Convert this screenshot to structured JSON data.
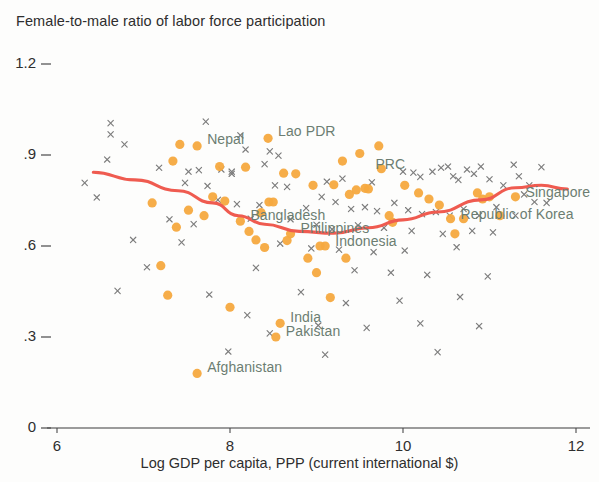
{
  "chart_data": {
    "type": "scatter",
    "title": "Female-to-male ratio of labor force participation",
    "xlabel": "Log GDP per capita, PPP (current international $)",
    "ylabel": "",
    "xlim": [
      5.6,
      12.3
    ],
    "ylim": [
      0,
      1.26
    ],
    "xticks": [
      "6",
      "8",
      "10",
      "12"
    ],
    "xtick_values": [
      6,
      8,
      10,
      12
    ],
    "yticks": [
      "1.2",
      ".9",
      ".6",
      ".3",
      "0"
    ],
    "ytick_values": [
      1.2,
      0.9,
      0.6,
      0.3,
      0
    ],
    "grid": false,
    "legend": "none",
    "colors": {
      "highlight_marker": "#F5A93F",
      "other_marker": "#7c7c7c",
      "trend_line": "#EF5B50",
      "label_text": "#6c7d72",
      "axis_text": "#2e2e2e",
      "background": "#fdfdfc"
    },
    "series": [
      {
        "name": "Asia and Pacific economies",
        "marker": "circle",
        "color": "#F5A93F",
        "labeled_points": [
          {
            "label": "Nepal",
            "x": 7.62,
            "y": 0.93,
            "label_dx": 10,
            "label_dy": -6
          },
          {
            "label": "Lao PDR",
            "x": 8.44,
            "y": 0.955,
            "label_dx": 10,
            "label_dy": -6
          },
          {
            "label": "PRC",
            "x": 9.75,
            "y": 0.855,
            "label_dx": -6,
            "label_dy": -4
          },
          {
            "label": "Bangladesh",
            "x": 8.12,
            "y": 0.682,
            "label_dx": 10,
            "label_dy": -5
          },
          {
            "label": "Philippines",
            "x": 8.7,
            "y": 0.64,
            "label_dx": 10,
            "label_dy": -5
          },
          {
            "label": "Indonesia",
            "x": 9.1,
            "y": 0.6,
            "label_dx": 10,
            "label_dy": -4
          },
          {
            "label": "Singapore",
            "x": 11.3,
            "y": 0.762,
            "label_dx": 10,
            "label_dy": -4
          },
          {
            "label": "Republic of Korea",
            "x": 10.55,
            "y": 0.69,
            "label_dx": 10,
            "label_dy": -4
          },
          {
            "label": "India",
            "x": 8.58,
            "y": 0.345,
            "label_dx": 10,
            "label_dy": -5
          },
          {
            "label": "Pakistan",
            "x": 8.53,
            "y": 0.3,
            "label_dx": 10,
            "label_dy": -5
          },
          {
            "label": "Afghanistan",
            "x": 7.62,
            "y": 0.18,
            "label_dx": 10,
            "label_dy": -5
          }
        ],
        "points": [
          {
            "x": 7.62,
            "y": 0.93
          },
          {
            "x": 8.44,
            "y": 0.955
          },
          {
            "x": 9.75,
            "y": 0.855
          },
          {
            "x": 8.12,
            "y": 0.682
          },
          {
            "x": 8.7,
            "y": 0.64
          },
          {
            "x": 9.1,
            "y": 0.6
          },
          {
            "x": 11.3,
            "y": 0.762
          },
          {
            "x": 10.55,
            "y": 0.69
          },
          {
            "x": 8.58,
            "y": 0.345
          },
          {
            "x": 8.53,
            "y": 0.3
          },
          {
            "x": 7.62,
            "y": 0.18
          },
          {
            "x": 7.42,
            "y": 0.935
          },
          {
            "x": 7.34,
            "y": 0.88
          },
          {
            "x": 7.88,
            "y": 0.862
          },
          {
            "x": 7.8,
            "y": 0.762
          },
          {
            "x": 7.94,
            "y": 0.748
          },
          {
            "x": 7.52,
            "y": 0.718
          },
          {
            "x": 7.7,
            "y": 0.7
          },
          {
            "x": 7.38,
            "y": 0.662
          },
          {
            "x": 7.2,
            "y": 0.535
          },
          {
            "x": 7.28,
            "y": 0.438
          },
          {
            "x": 8.0,
            "y": 0.398
          },
          {
            "x": 8.22,
            "y": 0.648
          },
          {
            "x": 8.3,
            "y": 0.62
          },
          {
            "x": 8.36,
            "y": 0.71
          },
          {
            "x": 8.45,
            "y": 0.745
          },
          {
            "x": 8.5,
            "y": 0.745
          },
          {
            "x": 8.62,
            "y": 0.84
          },
          {
            "x": 8.66,
            "y": 0.618
          },
          {
            "x": 8.4,
            "y": 0.595
          },
          {
            "x": 8.9,
            "y": 0.56
          },
          {
            "x": 9.0,
            "y": 0.512
          },
          {
            "x": 9.16,
            "y": 0.43
          },
          {
            "x": 8.96,
            "y": 0.8
          },
          {
            "x": 9.2,
            "y": 0.802
          },
          {
            "x": 9.38,
            "y": 0.77
          },
          {
            "x": 9.46,
            "y": 0.785
          },
          {
            "x": 9.56,
            "y": 0.79
          },
          {
            "x": 9.6,
            "y": 0.788
          },
          {
            "x": 9.3,
            "y": 0.88
          },
          {
            "x": 9.5,
            "y": 0.905
          },
          {
            "x": 9.72,
            "y": 0.93
          },
          {
            "x": 9.84,
            "y": 0.7
          },
          {
            "x": 9.88,
            "y": 0.678
          },
          {
            "x": 10.02,
            "y": 0.8
          },
          {
            "x": 10.18,
            "y": 0.775
          },
          {
            "x": 10.3,
            "y": 0.755
          },
          {
            "x": 10.42,
            "y": 0.735
          },
          {
            "x": 10.7,
            "y": 0.69
          },
          {
            "x": 10.86,
            "y": 0.775
          },
          {
            "x": 10.92,
            "y": 0.755
          },
          {
            "x": 11.0,
            "y": 0.762
          },
          {
            "x": 11.12,
            "y": 0.7
          },
          {
            "x": 8.18,
            "y": 0.86
          },
          {
            "x": 8.76,
            "y": 0.838
          },
          {
            "x": 9.04,
            "y": 0.6
          },
          {
            "x": 9.34,
            "y": 0.56
          },
          {
            "x": 10.6,
            "y": 0.64
          },
          {
            "x": 7.1,
            "y": 0.742
          }
        ]
      },
      {
        "name": "Other economies",
        "marker": "x",
        "color": "#7c7c7c",
        "points": [
          {
            "x": 6.62,
            "y": 1.005
          },
          {
            "x": 6.62,
            "y": 0.968
          },
          {
            "x": 7.72,
            "y": 1.01
          },
          {
            "x": 6.78,
            "y": 0.935
          },
          {
            "x": 8.12,
            "y": 0.965
          },
          {
            "x": 8.18,
            "y": 0.918
          },
          {
            "x": 8.46,
            "y": 0.912
          },
          {
            "x": 8.56,
            "y": 0.898
          },
          {
            "x": 8.4,
            "y": 0.87
          },
          {
            "x": 6.58,
            "y": 0.885
          },
          {
            "x": 7.18,
            "y": 0.858
          },
          {
            "x": 7.9,
            "y": 0.852
          },
          {
            "x": 7.52,
            "y": 0.845
          },
          {
            "x": 7.64,
            "y": 0.85
          },
          {
            "x": 8.02,
            "y": 0.838
          },
          {
            "x": 8.02,
            "y": 0.845
          },
          {
            "x": 6.32,
            "y": 0.808
          },
          {
            "x": 7.48,
            "y": 0.808
          },
          {
            "x": 7.74,
            "y": 0.798
          },
          {
            "x": 8.52,
            "y": 0.8
          },
          {
            "x": 8.66,
            "y": 0.795
          },
          {
            "x": 9.3,
            "y": 0.822
          },
          {
            "x": 9.12,
            "y": 0.812
          },
          {
            "x": 9.64,
            "y": 0.81
          },
          {
            "x": 10.0,
            "y": 0.845
          },
          {
            "x": 10.12,
            "y": 0.842
          },
          {
            "x": 10.2,
            "y": 0.828
          },
          {
            "x": 10.34,
            "y": 0.845
          },
          {
            "x": 10.44,
            "y": 0.858
          },
          {
            "x": 10.52,
            "y": 0.862
          },
          {
            "x": 10.58,
            "y": 0.83
          },
          {
            "x": 10.64,
            "y": 0.818
          },
          {
            "x": 10.74,
            "y": 0.852
          },
          {
            "x": 10.82,
            "y": 0.838
          },
          {
            "x": 10.9,
            "y": 0.862
          },
          {
            "x": 11.0,
            "y": 0.82
          },
          {
            "x": 11.16,
            "y": 0.8
          },
          {
            "x": 11.28,
            "y": 0.868
          },
          {
            "x": 11.6,
            "y": 0.86
          },
          {
            "x": 11.46,
            "y": 0.8
          },
          {
            "x": 7.86,
            "y": 0.752
          },
          {
            "x": 8.08,
            "y": 0.738
          },
          {
            "x": 8.34,
            "y": 0.735
          },
          {
            "x": 8.88,
            "y": 0.725
          },
          {
            "x": 9.06,
            "y": 0.762
          },
          {
            "x": 9.22,
            "y": 0.745
          },
          {
            "x": 9.4,
            "y": 0.722
          },
          {
            "x": 9.56,
            "y": 0.728
          },
          {
            "x": 9.7,
            "y": 0.715
          },
          {
            "x": 9.9,
            "y": 0.742
          },
          {
            "x": 10.06,
            "y": 0.718
          },
          {
            "x": 10.22,
            "y": 0.705
          },
          {
            "x": 10.38,
            "y": 0.712
          },
          {
            "x": 10.54,
            "y": 0.7
          },
          {
            "x": 10.7,
            "y": 0.722
          },
          {
            "x": 10.88,
            "y": 0.7
          },
          {
            "x": 11.08,
            "y": 0.728
          },
          {
            "x": 11.3,
            "y": 0.7
          },
          {
            "x": 7.3,
            "y": 0.688
          },
          {
            "x": 7.58,
            "y": 0.672
          },
          {
            "x": 8.24,
            "y": 0.69
          },
          {
            "x": 8.7,
            "y": 0.688
          },
          {
            "x": 9.0,
            "y": 0.67
          },
          {
            "x": 9.18,
            "y": 0.655
          },
          {
            "x": 9.48,
            "y": 0.668
          },
          {
            "x": 9.78,
            "y": 0.66
          },
          {
            "x": 10.1,
            "y": 0.65
          },
          {
            "x": 10.46,
            "y": 0.64
          },
          {
            "x": 10.8,
            "y": 0.65
          },
          {
            "x": 11.04,
            "y": 0.645
          },
          {
            "x": 6.88,
            "y": 0.62
          },
          {
            "x": 7.44,
            "y": 0.612
          },
          {
            "x": 8.58,
            "y": 0.608
          },
          {
            "x": 8.94,
            "y": 0.592
          },
          {
            "x": 9.26,
            "y": 0.588
          },
          {
            "x": 9.66,
            "y": 0.58
          },
          {
            "x": 10.02,
            "y": 0.585
          },
          {
            "x": 10.62,
            "y": 0.596
          },
          {
            "x": 7.04,
            "y": 0.53
          },
          {
            "x": 8.3,
            "y": 0.528
          },
          {
            "x": 9.44,
            "y": 0.52
          },
          {
            "x": 9.86,
            "y": 0.512
          },
          {
            "x": 10.28,
            "y": 0.505
          },
          {
            "x": 10.98,
            "y": 0.5
          },
          {
            "x": 6.7,
            "y": 0.452
          },
          {
            "x": 7.76,
            "y": 0.44
          },
          {
            "x": 8.82,
            "y": 0.448
          },
          {
            "x": 9.34,
            "y": 0.412
          },
          {
            "x": 9.96,
            "y": 0.42
          },
          {
            "x": 10.66,
            "y": 0.432
          },
          {
            "x": 8.2,
            "y": 0.372
          },
          {
            "x": 9.02,
            "y": 0.338
          },
          {
            "x": 9.58,
            "y": 0.33
          },
          {
            "x": 10.2,
            "y": 0.345
          },
          {
            "x": 10.88,
            "y": 0.336
          },
          {
            "x": 8.46,
            "y": 0.312
          },
          {
            "x": 7.98,
            "y": 0.252
          },
          {
            "x": 9.1,
            "y": 0.242
          },
          {
            "x": 10.4,
            "y": 0.25
          },
          {
            "x": 11.52,
            "y": 0.745
          },
          {
            "x": 11.4,
            "y": 0.77
          },
          {
            "x": 11.66,
            "y": 0.742
          },
          {
            "x": 6.46,
            "y": 0.76
          },
          {
            "x": 11.34,
            "y": 0.83
          }
        ]
      }
    ],
    "trend_line": {
      "name": "fitted trend",
      "color": "#EF5B50",
      "points": [
        {
          "x": 6.42,
          "y": 0.843
        },
        {
          "x": 6.9,
          "y": 0.818
        },
        {
          "x": 7.4,
          "y": 0.782
        },
        {
          "x": 7.8,
          "y": 0.742
        },
        {
          "x": 8.1,
          "y": 0.7
        },
        {
          "x": 8.4,
          "y": 0.672
        },
        {
          "x": 8.8,
          "y": 0.648
        },
        {
          "x": 9.2,
          "y": 0.642
        },
        {
          "x": 9.6,
          "y": 0.66
        },
        {
          "x": 10.0,
          "y": 0.686
        },
        {
          "x": 10.4,
          "y": 0.712
        },
        {
          "x": 10.9,
          "y": 0.752
        },
        {
          "x": 11.3,
          "y": 0.792
        },
        {
          "x": 11.6,
          "y": 0.8
        },
        {
          "x": 11.9,
          "y": 0.788
        }
      ]
    }
  }
}
